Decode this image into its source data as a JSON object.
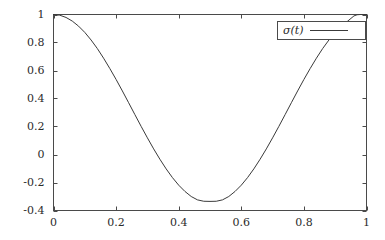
{
  "chart_data": {
    "type": "line",
    "title": "",
    "xlabel": "",
    "ylabel": "",
    "xlim": [
      0,
      1
    ],
    "ylim": [
      -0.4,
      1
    ],
    "grid": false,
    "legend_position": "top-right",
    "x_ticks": [
      "0",
      "0.2",
      "0.4",
      "0.6",
      "0.8",
      "1"
    ],
    "x_tick_values": [
      0,
      0.2,
      0.4,
      0.6,
      0.8,
      1
    ],
    "y_ticks": [
      "1",
      "0.8",
      "0.6",
      "0.4",
      "0.2",
      "0",
      "-0.2",
      "-0.4"
    ],
    "y_tick_values": [
      1,
      0.8,
      0.6,
      0.4,
      0.2,
      0,
      -0.2,
      -0.4
    ],
    "series": [
      {
        "name": "σ(t)",
        "color": "#3a3a3a",
        "x": [
          0,
          0.02,
          0.04,
          0.06,
          0.08,
          0.1,
          0.12,
          0.14,
          0.16,
          0.18,
          0.2,
          0.22,
          0.24,
          0.26,
          0.28,
          0.3,
          0.32,
          0.34,
          0.36,
          0.38,
          0.4,
          0.42,
          0.44,
          0.46,
          0.48,
          0.5,
          0.52,
          0.54,
          0.56,
          0.58,
          0.6,
          0.62,
          0.64,
          0.66,
          0.68,
          0.7,
          0.72,
          0.74,
          0.76,
          0.78,
          0.8,
          0.82,
          0.84,
          0.86,
          0.88,
          0.9,
          0.92,
          0.94,
          0.96,
          0.97,
          0.98,
          0.99,
          1
        ],
        "y": [
          1.0,
          0.995,
          0.979,
          0.953,
          0.917,
          0.872,
          0.818,
          0.757,
          0.688,
          0.614,
          0.536,
          0.454,
          0.37,
          0.285,
          0.201,
          0.119,
          0.04,
          -0.034,
          -0.103,
          -0.165,
          -0.219,
          -0.264,
          -0.3,
          -0.324,
          -0.334,
          -0.335,
          -0.334,
          -0.324,
          -0.3,
          -0.264,
          -0.219,
          -0.165,
          -0.103,
          -0.034,
          0.04,
          0.119,
          0.201,
          0.285,
          0.37,
          0.454,
          0.536,
          0.614,
          0.688,
          0.757,
          0.818,
          0.872,
          0.917,
          0.953,
          0.99,
          0.998,
          1.0,
          1.0,
          1.0
        ]
      }
    ],
    "annotations": []
  },
  "legend": {
    "entries": [
      {
        "label": "σ(t)"
      }
    ]
  },
  "axes": {
    "x_tick_labels": [
      "0",
      "0.2",
      "0.4",
      "0.6",
      "0.8",
      "1"
    ],
    "y_tick_labels": [
      "1",
      "0.8",
      "0.6",
      "0.4",
      "0.2",
      "0",
      "-0.2",
      "-0.4"
    ]
  },
  "colors": {
    "frame": "#4a4a4a",
    "curve": "#3a3a3a",
    "text": "#2b2b2b",
    "background": "#ffffff"
  }
}
